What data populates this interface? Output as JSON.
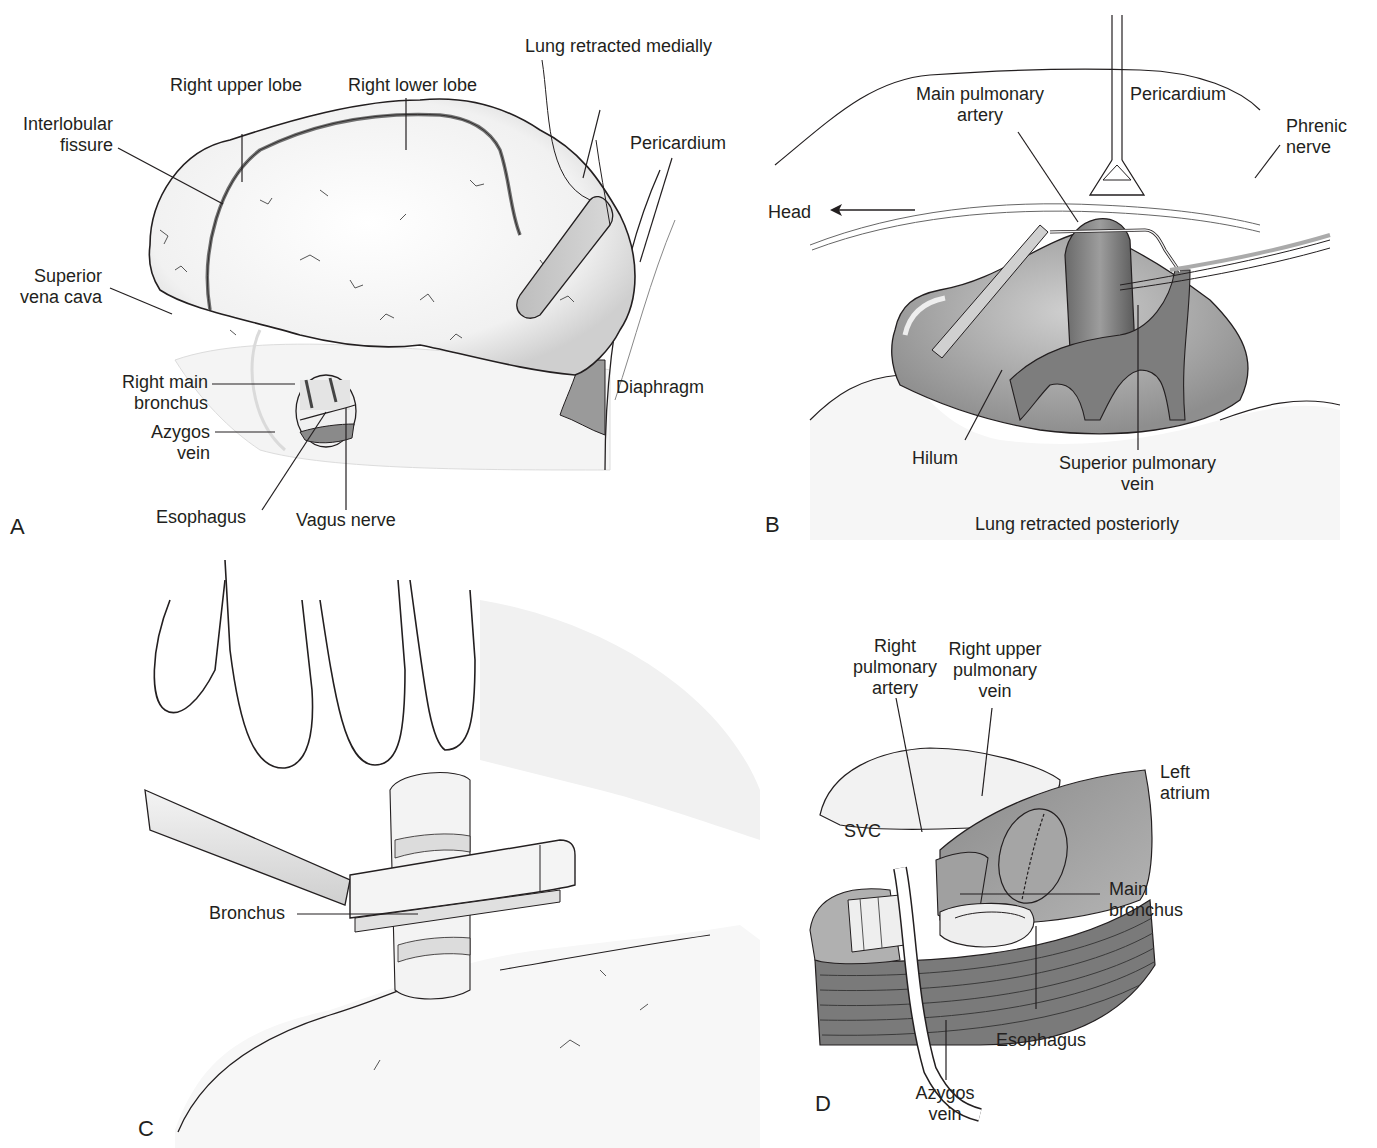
{
  "figure": {
    "panels": [
      {
        "letter": "A",
        "labels": {
          "lung_retracted": "Lung retracted medially",
          "right_upper_lobe": "Right upper lobe",
          "right_lower_lobe": "Right lower lobe",
          "interlobular_1": "Interlobular",
          "interlobular_2": "fissure",
          "pericardium": "Pericardium",
          "svc_1": "Superior",
          "svc_2": "vena cava",
          "rmb_1": "Right main",
          "rmb_2": "bronchus",
          "azygos_1": "Azygos",
          "azygos_2": "vein",
          "diaphragm": "Diaphragm",
          "esophagus": "Esophagus",
          "vagus": "Vagus nerve"
        }
      },
      {
        "letter": "B",
        "caption": "Lung retracted posteriorly",
        "labels": {
          "mpa_1": "Main pulmonary",
          "mpa_2": "artery",
          "pericardium": "Pericardium",
          "phrenic_1": "Phrenic",
          "phrenic_2": "nerve",
          "head": "Head",
          "hilum": "Hilum",
          "spv_1": "Superior pulmonary",
          "spv_2": "vein"
        }
      },
      {
        "letter": "C",
        "labels": {
          "bronchus": "Bronchus"
        }
      },
      {
        "letter": "D",
        "labels": {
          "rpa_1": "Right",
          "rpa_2": "pulmonary",
          "rpa_3": "artery",
          "rupv_1": "Right upper",
          "rupv_2": "pulmonary",
          "rupv_3": "vein",
          "left_atrium_1": "Left",
          "left_atrium_2": "atrium",
          "svc": "SVC",
          "main_bronchus_1": "Main",
          "main_bronchus_2": "bronchus",
          "esophagus": "Esophagus",
          "azygos_1": "Azygos",
          "azygos_2": "vein"
        }
      }
    ]
  }
}
